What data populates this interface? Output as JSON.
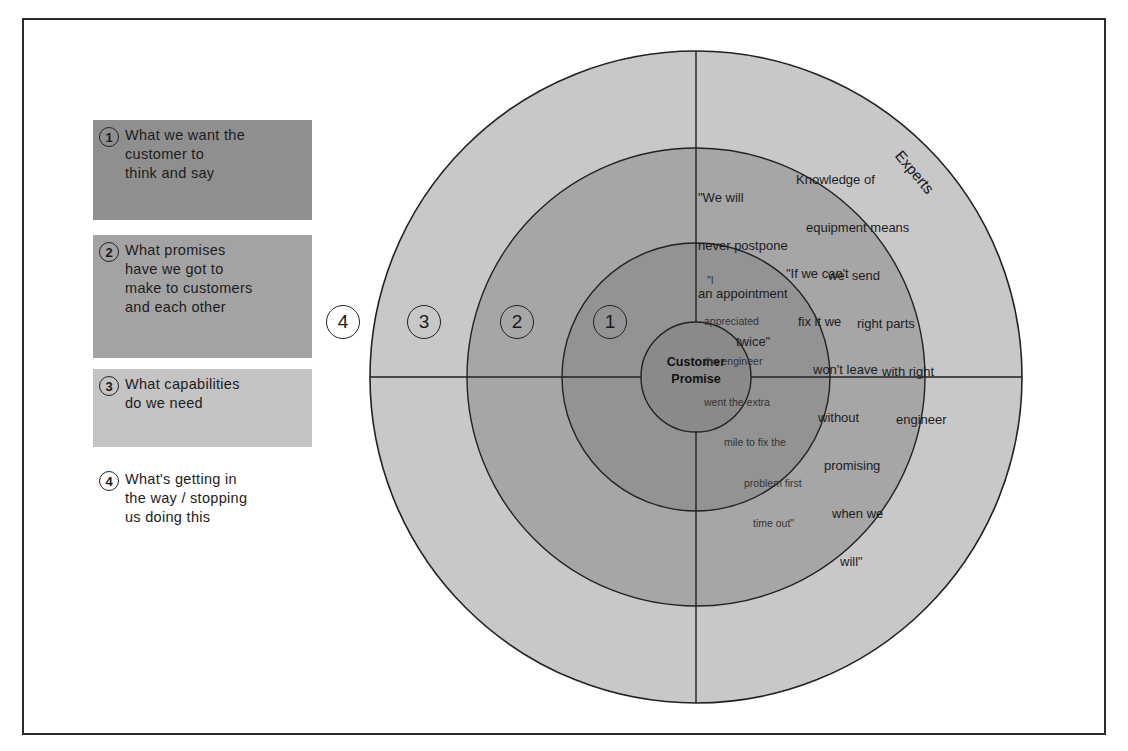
{
  "legend": [
    {
      "number": "1",
      "text": "What we want the customer to think and say",
      "lines": [
        "What we want the",
        "customer to",
        "think and say"
      ],
      "color": "#8f8f8f"
    },
    {
      "number": "2",
      "text": "What promises have we got to make to customers and each other",
      "lines": [
        "What promises",
        "have we got to",
        "make to customers",
        "and each other"
      ],
      "color": "#a3a3a3"
    },
    {
      "number": "3",
      "text": "What capabilities do we need",
      "lines": [
        "What capabilities",
        "do we need"
      ],
      "color": "#c4c4c4"
    },
    {
      "number": "4",
      "text": "What's getting in the way / stopping us doing this",
      "lines": [
        "What's getting in",
        "the way / stopping",
        "us doing this"
      ],
      "color": "#ffffff"
    }
  ],
  "diagram": {
    "center_label": [
      "Customer",
      "Promise"
    ],
    "ring_numbers": [
      "4",
      "3",
      "2",
      "1"
    ],
    "ring_colors": {
      "center": "#8a8a8a",
      "ring1": "#939393",
      "ring2": "#a6a6a6",
      "ring3": "#c8c8c8"
    },
    "arc_label": "Experts",
    "quotes": {
      "ring1": [
        "\"I",
        "appreciated",
        "the engineer",
        "went the extra",
        "mile to fix the",
        "problem first",
        "time out\""
      ],
      "ring2_a": [
        "\"We will",
        "never postpone",
        "an appointment",
        "twice\""
      ],
      "ring2_b": [
        "\"If we can't",
        "fix it we",
        "won't leave",
        "without",
        "promising",
        "when we",
        "will\""
      ],
      "ring3": [
        "Knowledge of",
        "equipment means",
        "we  send",
        "right parts",
        "with right",
        "engineer"
      ]
    }
  }
}
